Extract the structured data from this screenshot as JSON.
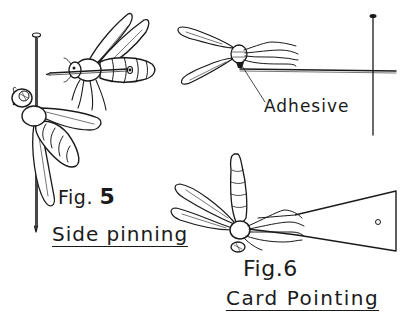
{
  "figure5": {
    "fig_label": "Fig.",
    "fig_number": "5",
    "caption": "Side pinning"
  },
  "figure6": {
    "fig_label": "Fig.",
    "fig_number": "6",
    "caption": "Card Pointing"
  },
  "annotations": {
    "adhesive": "Adhesive"
  },
  "colors": {
    "ink": "#1a1a1a",
    "paper": "#ffffff"
  }
}
